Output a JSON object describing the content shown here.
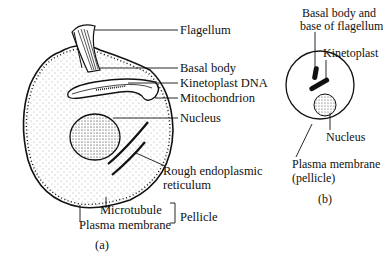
{
  "panel_a": {
    "caption": "(a)",
    "labels": {
      "flagellum": "Flagellum",
      "basal_body": "Basal body",
      "kinetoplast_dna": "Kinetoplast DNA",
      "mitochondrion": "Mitochondrion",
      "nucleus": "Nucleus",
      "rer_line1": "Rough endoplasmic",
      "rer_line2": "reticulum",
      "microtubule": "Microtubule",
      "plasma_membrane": "Plasma membrane",
      "pellicle": "Pellicle"
    }
  },
  "panel_b": {
    "caption": "(b)",
    "labels": {
      "basal_line1": "Basal body and",
      "basal_line2": "base of flagellum",
      "kinetoplast": "Kinetoplast",
      "nucleus": "Nucleus",
      "pm_line1": "Plasma membrane",
      "pm_line2": "(pellicle)"
    }
  }
}
